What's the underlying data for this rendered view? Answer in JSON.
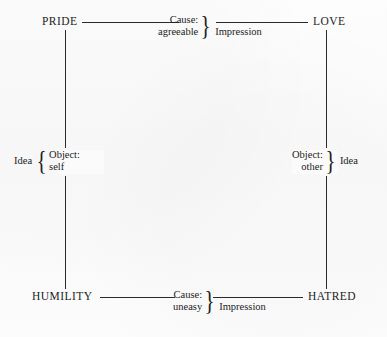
{
  "diagram": {
    "nodes": {
      "top_left": "PRIDE",
      "top_right": "LOVE",
      "bottom_left": "HUMILITY",
      "bottom_right": "HATRED"
    },
    "edges": {
      "top": {
        "relation_line1": "Cause:",
        "relation_line2": "agreeable",
        "relation_kind": "Impression"
      },
      "bottom": {
        "relation_line1": "Cause:",
        "relation_line2": "uneasy",
        "relation_kind": "Impression"
      },
      "left": {
        "relation_line1": "Object:",
        "relation_line2": "self",
        "relation_kind": "Idea"
      },
      "right": {
        "relation_line1": "Object:",
        "relation_line2": "other",
        "relation_kind": "Idea"
      }
    },
    "braces": {
      "right_facing": "}",
      "left_facing": "{"
    },
    "colors": {
      "ink": "#1c1c1c",
      "rule": "#2b2b2b",
      "paper": "#fcfcfc"
    }
  }
}
